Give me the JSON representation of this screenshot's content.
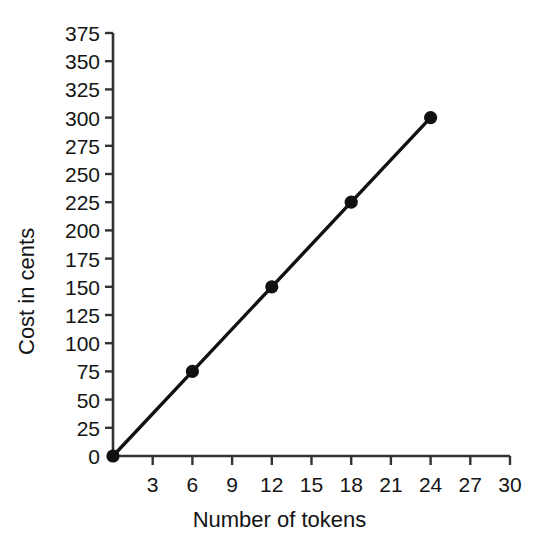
{
  "chart_data": {
    "type": "line",
    "title": "",
    "subtitle": "",
    "xlabel": "Number of tokens",
    "ylabel": "Cost in cents",
    "x": [
      0,
      6,
      12,
      18,
      24
    ],
    "values": [
      0,
      75,
      150,
      225,
      300
    ],
    "series": [
      {
        "name": "Cost",
        "x": [
          0,
          6,
          12,
          18,
          24
        ],
        "values": [
          0,
          75,
          150,
          225,
          300
        ]
      }
    ],
    "points": [
      {
        "x": 0,
        "y": 0
      },
      {
        "x": 6,
        "y": 75
      },
      {
        "x": 12,
        "y": 150
      },
      {
        "x": 18,
        "y": 225
      },
      {
        "x": 24,
        "y": 300
      }
    ],
    "xlim": [
      0,
      30
    ],
    "ylim": [
      0,
      375
    ],
    "xtick_values": [
      0,
      3,
      6,
      9,
      12,
      15,
      18,
      21,
      24,
      27,
      30
    ],
    "xtick_labels": [
      "",
      "3",
      "6",
      "9",
      "12",
      "15",
      "18",
      "21",
      "24",
      "27",
      "30"
    ],
    "ytick_values": [
      0,
      25,
      50,
      75,
      100,
      125,
      150,
      175,
      200,
      225,
      250,
      275,
      300,
      325,
      350,
      375
    ],
    "ytick_labels": [
      "0",
      "25",
      "50",
      "75",
      "100",
      "125",
      "150",
      "175",
      "200",
      "225",
      "250",
      "275",
      "300",
      "325",
      "350",
      "375"
    ],
    "grid": false,
    "legend": false,
    "legend_position": "none",
    "line_color": "#111111",
    "marker_color": "#111111",
    "marker_shape": "circle",
    "axis_color": "#333333",
    "background_color": "#ffffff"
  },
  "axis_titles": {
    "x": "Number of tokens",
    "y": "Cost in cents"
  }
}
